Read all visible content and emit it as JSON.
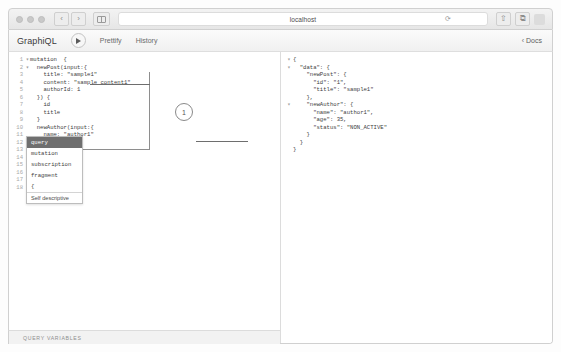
{
  "browser": {
    "url": "localhost",
    "traffic_lights": [
      "close",
      "minimize",
      "zoom"
    ],
    "back_label": "‹",
    "forward_label": "›",
    "sidebar_icon": "sidebar-icon",
    "reload_icon": "⟳",
    "share_icon": "⇧",
    "tabs_icon": "⧉"
  },
  "graphiql": {
    "logo": "GraphiQL",
    "execute_label": "execute-query",
    "prettify_label": "Prettify",
    "history_label": "History",
    "docs_label": "Docs",
    "docs_chevron": "‹"
  },
  "editor": {
    "lines": [
      {
        "num": "1",
        "fold": "▾",
        "text": "mutation  {"
      },
      {
        "num": "2",
        "fold": "▾",
        "text": "  newPost(input:{"
      },
      {
        "num": "3",
        "fold": "",
        "text": "    title: \"sample1\""
      },
      {
        "num": "4",
        "fold": "",
        "text": "    content: \"sample content1\""
      },
      {
        "num": "5",
        "fold": "",
        "text": "    authorId: 1"
      },
      {
        "num": "6",
        "fold": "",
        "text": "  }) {"
      },
      {
        "num": "7",
        "fold": "",
        "text": "    id"
      },
      {
        "num": "8",
        "fold": "",
        "text": "    title"
      },
      {
        "num": "9",
        "fold": "",
        "text": "  }"
      },
      {
        "num": "10",
        "fold": "",
        "text": "  newAuthor(input:{"
      },
      {
        "num": "11",
        "fold": "",
        "text": "    name: \"author1\""
      },
      {
        "num": "12",
        "fold": "",
        "text": "    age: 35"
      },
      {
        "num": "13",
        "fold": "▾",
        "text": "  }) {"
      },
      {
        "num": "14",
        "fold": "",
        "text": "    name"
      },
      {
        "num": "15",
        "fold": "",
        "text": "    age"
      },
      {
        "num": "16",
        "fold": "",
        "text": "    status"
      },
      {
        "num": "17",
        "fold": "",
        "text": "  }"
      },
      {
        "num": "18",
        "fold": "",
        "text": "}"
      }
    ]
  },
  "autocomplete": {
    "items": [
      {
        "label": "query",
        "selected": true
      },
      {
        "label": "mutation",
        "selected": false
      },
      {
        "label": "subscription",
        "selected": false
      },
      {
        "label": "fragment",
        "selected": false
      },
      {
        "label": "{",
        "selected": false
      }
    ],
    "hint": "Self descriptive"
  },
  "result": {
    "lines": [
      {
        "fold": "▾",
        "text": "{"
      },
      {
        "fold": "▾",
        "text": "  \"data\": {"
      },
      {
        "fold": "",
        "text": "    \"newPost\": {"
      },
      {
        "fold": "",
        "text": "      \"id\": \"1\","
      },
      {
        "fold": "",
        "text": "      \"title\": \"sample1\""
      },
      {
        "fold": "",
        "text": "    },"
      },
      {
        "fold": "▾",
        "text": "    \"newAuthor\": {"
      },
      {
        "fold": "",
        "text": "      \"name\": \"author1\","
      },
      {
        "fold": "",
        "text": "      \"age\": 35,"
      },
      {
        "fold": "",
        "text": "      \"status\": \"NON_ACTIVE\""
      },
      {
        "fold": "",
        "text": "    }"
      },
      {
        "fold": "",
        "text": "  }"
      },
      {
        "fold": "",
        "text": "}"
      }
    ]
  },
  "annotation": {
    "marker_label": "1"
  },
  "footer": {
    "query_variables_label": "QUERY VARIABLES"
  }
}
